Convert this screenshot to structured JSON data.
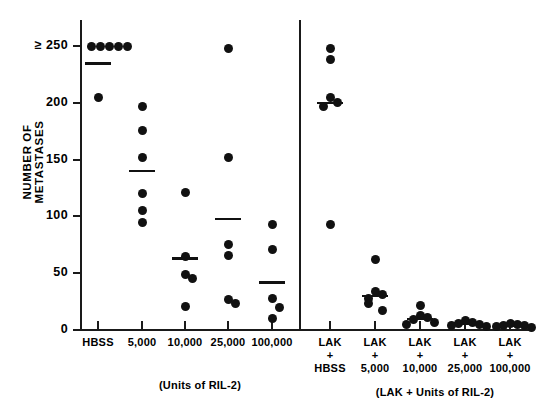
{
  "figure": {
    "ylabel": "NUMBER OF METASTASES",
    "left_panel_caption": "(Units of RIL-2)",
    "right_panel_caption": "(LAK + Units of RIL-2)"
  },
  "chart_data": {
    "type": "scatter",
    "title": "",
    "xlabel": "",
    "ylabel": "NUMBER OF METASTASES",
    "ylim": [
      0,
      250
    ],
    "yticks": [
      0,
      50,
      100,
      150,
      200,
      250
    ],
    "ytick_labels": [
      "0",
      "50",
      "100",
      "150",
      "200",
      "≥ 250"
    ],
    "grid": false,
    "legend": false,
    "panels": [
      {
        "name": "RIL-2 alone",
        "caption": "(Units of RIL-2)",
        "groups": [
          {
            "label": "HBSS",
            "label_lines": [
              "HBSS"
            ],
            "values": [
              250,
              250,
              250,
              250,
              250,
              205
            ],
            "mean": 235
          },
          {
            "label": "5,000",
            "label_lines": [
              "5,000"
            ],
            "values": [
              197,
              176,
              152,
              120,
              105,
              95
            ],
            "mean": 140
          },
          {
            "label": "10,000",
            "label_lines": [
              "10,000"
            ],
            "values": [
              121,
              65,
              49,
              45,
              21
            ],
            "mean": 63
          },
          {
            "label": "25,000",
            "label_lines": [
              "25,000"
            ],
            "values": [
              248,
              152,
              75,
              66,
              27,
              23
            ],
            "mean": 98
          },
          {
            "label": "100,000",
            "label_lines": [
              "100,000"
            ],
            "values": [
              93,
              71,
              28,
              20,
              10
            ],
            "mean": 42
          }
        ]
      },
      {
        "name": "LAK + RIL-2",
        "caption": "(LAK + Units of RIL-2)",
        "groups": [
          {
            "label": "LAK + HBSS",
            "label_lines": [
              "LAK",
              "+",
              "HBSS"
            ],
            "values": [
              248,
              238,
              205,
              200,
              197,
              93
            ],
            "mean": 200
          },
          {
            "label": "LAK + 5,000",
            "label_lines": [
              "LAK",
              "+",
              "5,000"
            ],
            "values": [
              62,
              34,
              31,
              28,
              23,
              17
            ],
            "mean": 30
          },
          {
            "label": "LAK + 10,000",
            "label_lines": [
              "LAK",
              "+",
              "10,000"
            ],
            "values": [
              22,
              13,
              11,
              9,
              7,
              5
            ],
            "mean": 10
          },
          {
            "label": "LAK + 25,000",
            "label_lines": [
              "LAK",
              "+",
              "25,000"
            ],
            "values": [
              8,
              7,
              6,
              5,
              4,
              3
            ],
            "mean": 6
          },
          {
            "label": "LAK + 100,000",
            "label_lines": [
              "LAK",
              "+",
              "100,000"
            ],
            "values": [
              6,
              5,
              4,
              4,
              3,
              2
            ],
            "mean": 4
          }
        ]
      }
    ]
  }
}
